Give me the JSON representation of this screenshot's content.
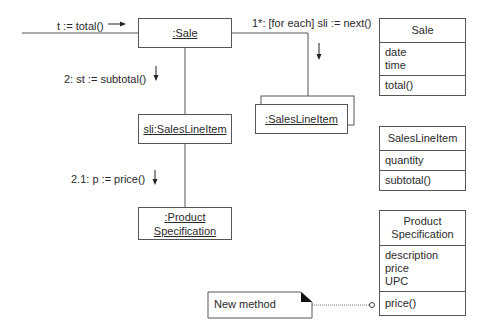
{
  "messages": {
    "msg_total": "t := total()",
    "msg_next": "1*: [for each] sli := next()",
    "msg_subtotal": "2: st := subtotal()",
    "msg_price": "2.1: p := price()"
  },
  "objects": {
    "sale": ":Sale",
    "sli": "sli:SalesLineItem",
    "multi_sli": ":SalesLineItem",
    "prodspec_line1": ":Product",
    "prodspec_line2": "Specification"
  },
  "classes": {
    "sale": {
      "name": "Sale",
      "attributes": [
        "date",
        "time"
      ],
      "operations": [
        "total()"
      ]
    },
    "sales_line_item": {
      "name": "SalesLineItem",
      "attributes": [
        "quantity"
      ],
      "operations": [
        "subtotal()"
      ]
    },
    "product_specification": {
      "name_line1": "Product",
      "name_line2": "Specification",
      "attributes": [
        "description",
        "price",
        "UPC"
      ],
      "operations": [
        "price()"
      ]
    }
  },
  "note": {
    "text": "New method"
  }
}
